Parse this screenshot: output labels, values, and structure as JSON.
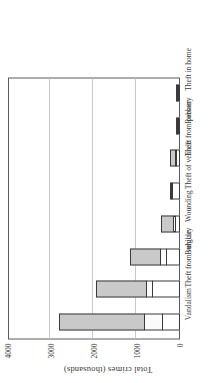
{
  "chart_data": {
    "type": "bar",
    "stacked": true,
    "orientation": "vertical",
    "rendered_rotation_deg": -90,
    "title": "",
    "xlabel": "",
    "ylabel": "Total crimes (thousands)",
    "ylim": [
      0,
      4000
    ],
    "yticks": [
      0,
      1000,
      2000,
      3000,
      4000
    ],
    "ytick_labels": [
      "0",
      "1000",
      "2000",
      "3000",
      "4000"
    ],
    "grid": true,
    "gridline_values": [
      1000,
      2000,
      3000
    ],
    "legend": "none",
    "categories": [
      "Vandalism",
      "Theft from vehicle",
      "Burglary",
      "Wounding",
      "Theft of vehicle",
      "Theft from person",
      "Robbery",
      "Theft in home"
    ],
    "series": [
      {
        "name": "segment-1",
        "color": "#ffffff",
        "values": [
          430,
          660,
          330,
          115,
          190,
          100,
          50,
          30
        ]
      },
      {
        "name": "segment-2",
        "color": "#fbfbfb",
        "values": [
          440,
          160,
          170,
          75,
          45,
          35,
          35,
          15
        ]
      },
      {
        "name": "segment-3",
        "color": "#c9c9c9",
        "values": [
          2000,
          1180,
          720,
          300,
          20,
          125,
          45,
          50
        ]
      }
    ],
    "totals": [
      2870,
      2000,
      1220,
      490,
      255,
      260,
      130,
      95
    ]
  },
  "axis": {
    "title": "Total crimes (thousands)"
  }
}
